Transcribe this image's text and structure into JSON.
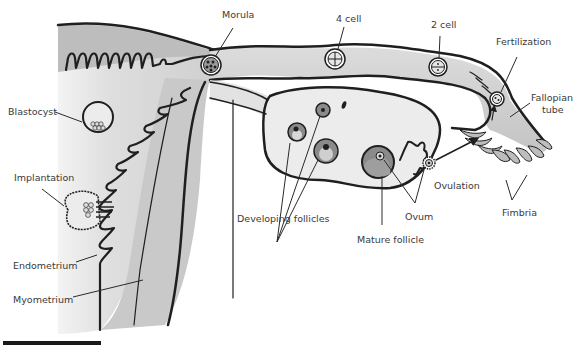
{
  "diagram": {
    "colors": {
      "tissue_light": "#e6e6e6",
      "tissue_mid": "#c8c8c8",
      "tissue_dark": "#9a9a9a",
      "outline": "#1f1f1f",
      "label_text": "#3a3a3a"
    },
    "labels": {
      "morula": "Morula",
      "four_cell": "4 cell",
      "two_cell": "2 cell",
      "fertilization": "Fertilization",
      "fallopian_tube_line1": "Fallopian",
      "fallopian_tube_line2": "tube",
      "blastocyst": "Blastocyst",
      "implantation": "Implantation",
      "endometrium": "Endometrium",
      "myometrium": "Myometrium",
      "developing_follicles": "Developing follicles",
      "mature_follicle": "Mature follicle",
      "ovum": "Ovum",
      "ovulation": "Ovulation",
      "fimbria": "Fimbria"
    }
  }
}
